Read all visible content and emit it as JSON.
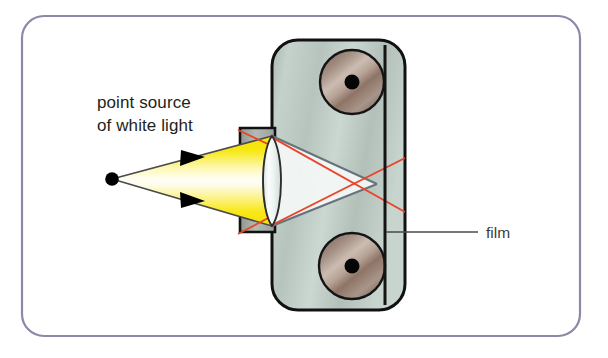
{
  "figure": {
    "background_color": "#ffffff",
    "frame": {
      "name": "rounded-frame",
      "border_color": "#8f86a8",
      "x": 22,
      "y": 16,
      "width": 558,
      "height": 320,
      "radius": 22
    },
    "labels": {
      "point_source_line1": "point source",
      "point_source_line2": "of white light",
      "film": "film"
    },
    "colors": {
      "light_cone_yellow": "#f7e500",
      "light_cone_pale": "#ffffff",
      "camera_body": "#bfcdc6",
      "camera_outline": "#1a1a1a",
      "spool_fill": "#9c8678",
      "spool_hub": "#000000",
      "ray_red": "#e8442a",
      "ray_gray": "#6f7b85",
      "lens_glass": "#e9f0ef",
      "barrel_gray": "#9aa19c",
      "point_dot": "#000000",
      "frame_border": "#8f86a8",
      "leader_line": "#4a4a4a"
    },
    "elements": {
      "point_source_dot": {
        "cx": 112,
        "cy": 179,
        "r": 6.5
      },
      "camera_body": {
        "x": 272,
        "y": 40,
        "width": 133,
        "height": 270,
        "radius": 26
      },
      "film_plane": {
        "x": 385,
        "y1": 45,
        "y2": 305
      },
      "lens_barrel": {
        "x": 240,
        "y": 128,
        "width": 34,
        "height": 104
      },
      "lens": {
        "cx": 272,
        "cy": 181,
        "half_width": 11,
        "half_height": 45
      },
      "spool_top": {
        "cx": 352,
        "cy": 82,
        "r": 32
      },
      "spool_bottom": {
        "cx": 352,
        "cy": 266,
        "r": 33
      },
      "spool_hub_r": 7.5,
      "film_leader": {
        "x1": 385,
        "y1": 232,
        "x2": 478,
        "y2": 232
      },
      "arrow_upper": {
        "x": 196,
        "y": 159
      },
      "arrow_lower": {
        "x": 196,
        "y": 199
      }
    }
  }
}
